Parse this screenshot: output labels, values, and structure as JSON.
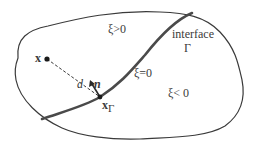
{
  "diagram": {
    "colors": {
      "boundary": "#3a3a3a",
      "interface": "#4a4a4a",
      "text": "#3a3a3a",
      "background": "#ffffff"
    },
    "labels": {
      "region_positive": "ξ>0",
      "region_zero": "ξ=0",
      "region_negative": "ξ< 0",
      "interface_word": "interface",
      "interface_symbol": "Γ",
      "point": "x",
      "distance": "d",
      "normal": "n",
      "projected_point": "x",
      "projected_point_subscript": "Γ"
    },
    "elements": [
      {
        "name": "domain-boundary",
        "kind": "closed curve"
      },
      {
        "name": "interface-curve",
        "kind": "thick curve",
        "label": "Γ, ξ=0"
      },
      {
        "name": "point-x",
        "kind": "dot"
      },
      {
        "name": "point-x-gamma",
        "kind": "dot on interface"
      },
      {
        "name": "distance-line",
        "kind": "dashed line from x to xΓ",
        "label": "d"
      },
      {
        "name": "normal-arrow",
        "kind": "arrow at xΓ",
        "label": "n"
      }
    ]
  }
}
